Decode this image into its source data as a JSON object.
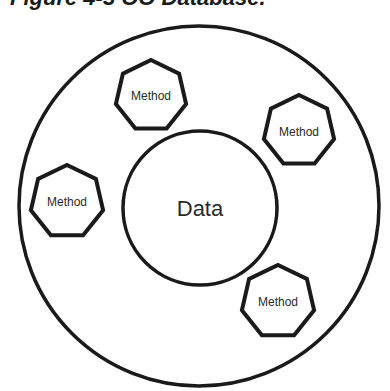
{
  "title": "Figure 4-3 OO Database.",
  "diagram": {
    "outer_circle": {
      "cx": 199,
      "cy": 206,
      "r": 181
    },
    "data_circle": {
      "cx": 200,
      "cy": 208,
      "r": 77,
      "label": "Data"
    },
    "methods": [
      {
        "label": "Method",
        "cx": 151,
        "cy": 96,
        "r": 36
      },
      {
        "label": "Method",
        "cx": 299,
        "cy": 131,
        "r": 36
      },
      {
        "label": "Method",
        "cx": 67,
        "cy": 202,
        "r": 37
      },
      {
        "label": "Method",
        "cx": 278,
        "cy": 302,
        "r": 37
      }
    ],
    "stroke_color": "#1a1a1a",
    "text_color": "#2a2a2a"
  }
}
